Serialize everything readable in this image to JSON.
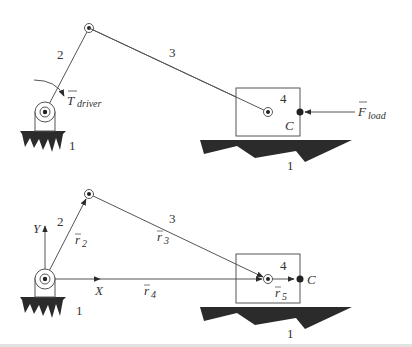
{
  "figure": {
    "type": "slider-crank mechanism diagram",
    "colors": {
      "line": "#555555",
      "fill": "#2b2b2b",
      "background": "#ffffff"
    }
  },
  "top_diagram": {
    "link_labels": {
      "ground_left": "1",
      "crank": "2",
      "coupler": "3",
      "slider": "4",
      "ground_right": "1"
    },
    "point_label_C": "C",
    "torque": {
      "symbol": "T",
      "subscript": "driver"
    },
    "force": {
      "symbol": "F",
      "subscript": "load"
    }
  },
  "bottom_diagram": {
    "link_labels": {
      "ground_left": "1",
      "crank": "2",
      "coupler": "3",
      "slider": "4",
      "ground_right": "1"
    },
    "point_label_C": "C",
    "axes": {
      "x": "X",
      "y": "Y"
    },
    "vectors": [
      {
        "symbol": "r",
        "subscript": "2"
      },
      {
        "symbol": "r",
        "subscript": "3"
      },
      {
        "symbol": "r",
        "subscript": "4"
      },
      {
        "symbol": "r",
        "subscript": "5"
      }
    ]
  }
}
